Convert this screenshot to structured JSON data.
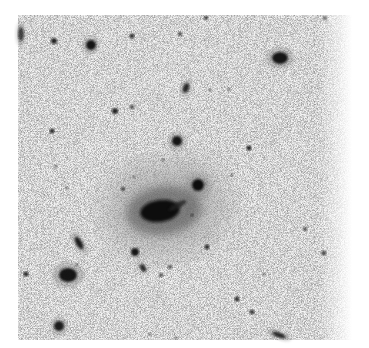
{
  "image": {
    "description": "Inverted grayscale astronomical field showing a central elliptical galaxy with a companion, surrounded by field stars and small galaxies",
    "width": 369,
    "height": 348,
    "field": {
      "x": 18,
      "y": 15,
      "w": 334,
      "h": 325
    },
    "colors": {
      "background": "#ffffff",
      "sky": "#f4f4f4",
      "object": "#111111"
    },
    "main_galaxy": {
      "cx": 160,
      "cy": 211,
      "rx": 20,
      "ry": 11,
      "halo_rx": 62,
      "halo_ry": 48,
      "angle": -8
    },
    "companion": {
      "cx": 198,
      "cy": 185,
      "r": 6
    },
    "objects": [
      {
        "name": "edge-galaxy",
        "cx": 21,
        "cy": 34,
        "rx": 3,
        "ry": 7,
        "o": 0.7,
        "angle": 0
      },
      {
        "name": "star",
        "cx": 54,
        "cy": 41,
        "r": 3,
        "o": 0.9
      },
      {
        "name": "galaxy",
        "cx": 91,
        "cy": 45,
        "r": 5,
        "o": 0.95
      },
      {
        "name": "star",
        "cx": 132,
        "cy": 36,
        "r": 2.5,
        "o": 0.85
      },
      {
        "name": "star",
        "cx": 180,
        "cy": 34,
        "r": 2,
        "o": 0.8
      },
      {
        "name": "star",
        "cx": 206,
        "cy": 18,
        "r": 2,
        "o": 0.85
      },
      {
        "name": "star",
        "cx": 325,
        "cy": 18,
        "r": 2,
        "o": 0.8
      },
      {
        "name": "galaxy",
        "cx": 280,
        "cy": 58,
        "rx": 8,
        "ry": 6,
        "o": 0.95,
        "angle": 0
      },
      {
        "name": "galaxy",
        "cx": 186,
        "cy": 88,
        "rx": 3,
        "ry": 5,
        "o": 0.85,
        "angle": 20
      },
      {
        "name": "star",
        "cx": 210,
        "cy": 90,
        "r": 1.5,
        "o": 0.7
      },
      {
        "name": "star",
        "cx": 229,
        "cy": 89,
        "r": 1.5,
        "o": 0.7
      },
      {
        "name": "star",
        "cx": 115,
        "cy": 111,
        "r": 3,
        "o": 0.9
      },
      {
        "name": "star",
        "cx": 132,
        "cy": 107,
        "r": 2,
        "o": 0.85
      },
      {
        "name": "star",
        "cx": 52,
        "cy": 131,
        "r": 2.5,
        "o": 0.9
      },
      {
        "name": "galaxy",
        "cx": 177,
        "cy": 141,
        "r": 5,
        "o": 0.95
      },
      {
        "name": "star",
        "cx": 249,
        "cy": 148,
        "r": 2.5,
        "o": 0.9
      },
      {
        "name": "star",
        "cx": 163,
        "cy": 160,
        "r": 1.5,
        "o": 0.6
      },
      {
        "name": "star",
        "cx": 56,
        "cy": 166,
        "r": 1.5,
        "o": 0.7
      },
      {
        "name": "star",
        "cx": 67,
        "cy": 188,
        "r": 1.5,
        "o": 0.6
      },
      {
        "name": "star",
        "cx": 123,
        "cy": 189,
        "r": 2,
        "o": 0.8
      },
      {
        "name": "star",
        "cx": 134,
        "cy": 177,
        "r": 1.5,
        "o": 0.6
      },
      {
        "name": "star",
        "cx": 206,
        "cy": 184,
        "r": 1,
        "o": 0.5
      },
      {
        "name": "star",
        "cx": 232,
        "cy": 175,
        "r": 1.5,
        "o": 0.6
      },
      {
        "name": "star",
        "cx": 305,
        "cy": 229,
        "r": 2,
        "o": 0.75
      },
      {
        "name": "star",
        "cx": 324,
        "cy": 253,
        "r": 2.5,
        "o": 0.9
      },
      {
        "name": "star",
        "cx": 207,
        "cy": 247,
        "r": 2.5,
        "o": 0.85
      },
      {
        "name": "galaxy",
        "cx": 79,
        "cy": 243,
        "rx": 3,
        "ry": 7,
        "o": 0.9,
        "angle": -30
      },
      {
        "name": "star",
        "cx": 135,
        "cy": 252,
        "r": 4,
        "o": 0.95
      },
      {
        "name": "galaxy",
        "cx": 143,
        "cy": 268,
        "rx": 2.5,
        "ry": 4,
        "o": 0.85,
        "angle": -35
      },
      {
        "name": "star",
        "cx": 170,
        "cy": 267,
        "r": 2,
        "o": 0.75
      },
      {
        "name": "star",
        "cx": 161,
        "cy": 275,
        "r": 2,
        "o": 0.75
      },
      {
        "name": "star",
        "cx": 77,
        "cy": 265,
        "r": 1.5,
        "o": 0.6
      },
      {
        "name": "galaxy",
        "cx": 68,
        "cy": 275,
        "rx": 9,
        "ry": 7,
        "o": 0.95,
        "angle": 0
      },
      {
        "name": "star",
        "cx": 26,
        "cy": 274,
        "r": 2.5,
        "o": 0.9
      },
      {
        "name": "star",
        "cx": 264,
        "cy": 274,
        "r": 1.5,
        "o": 0.6
      },
      {
        "name": "star",
        "cx": 237,
        "cy": 299,
        "r": 2.5,
        "o": 0.85
      },
      {
        "name": "star",
        "cx": 252,
        "cy": 312,
        "r": 2.5,
        "o": 0.8
      },
      {
        "name": "galaxy",
        "cx": 59,
        "cy": 326,
        "r": 5,
        "o": 0.9
      },
      {
        "name": "star",
        "cx": 150,
        "cy": 334,
        "r": 1.5,
        "o": 0.6
      },
      {
        "name": "star",
        "cx": 176,
        "cy": 338,
        "r": 1.5,
        "o": 0.6
      },
      {
        "name": "edge-galaxy",
        "cx": 279,
        "cy": 335,
        "rx": 7,
        "ry": 2.5,
        "o": 0.85,
        "angle": 20
      },
      {
        "name": "star",
        "cx": 192,
        "cy": 215,
        "r": 1.5,
        "o": 0.7
      }
    ]
  }
}
